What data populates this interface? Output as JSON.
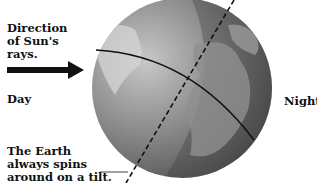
{
  "diagram": {
    "labels": {
      "sun_rays": [
        "Direction",
        "of Sun's",
        "rays."
      ],
      "day": "Day",
      "night": "Night",
      "tilt_note": [
        "The Earth",
        "always spins",
        "around on a tilt."
      ]
    },
    "elements": {
      "arrow": "Sun's rays arrow pointing right toward globe",
      "globe": "Earth globe with continents, shaded night side",
      "axis": "dashed tilted rotation axis",
      "terminator": "curved line dividing day and night"
    },
    "colors": {
      "globe_light": "#bdbdbd",
      "globe_dark": "#5a5a5a",
      "land": "#8f8f8f",
      "text": "#111111"
    }
  }
}
